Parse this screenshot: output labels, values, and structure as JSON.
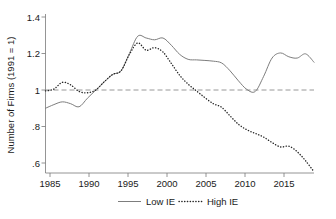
{
  "chart_data": {
    "type": "line",
    "title": "",
    "xlabel": "",
    "ylabel": "Number of Firms (1991 = 1)",
    "xlim": [
      1985,
      2017
    ],
    "ylim": [
      0.52,
      1.45
    ],
    "grid": false,
    "legend_position": "bottom",
    "xticks": [
      1985,
      1990,
      1995,
      2000,
      2005,
      2010,
      2015
    ],
    "xtick_labels": [
      "1985",
      "1990",
      "1995",
      "2000",
      "2005",
      "2010",
      "2015"
    ],
    "yticks": [
      0.6,
      0.8,
      1.0,
      1.2,
      1.4
    ],
    "ytick_labels": [
      ".6",
      ".8",
      "1",
      "1.2",
      "1.4"
    ],
    "reference_line": {
      "y": 1.0,
      "style": "dashed",
      "color": "#8d8d8d"
    },
    "x": [
      1985,
      1986,
      1987,
      1988,
      1989,
      1990,
      1991,
      1992,
      1993,
      1994,
      1995,
      1996,
      1997,
      1998,
      1999,
      2000,
      2001,
      2002,
      2003,
      2004,
      2005,
      2006,
      2007,
      2008,
      2009,
      2010,
      2011,
      2012,
      2013,
      2014,
      2015,
      2016,
      2017
    ],
    "series": [
      {
        "name": "Low IE",
        "style": "solid",
        "color": "#7d7d7d",
        "values": [
          0.9,
          0.92,
          0.935,
          0.925,
          0.908,
          0.955,
          1.0,
          1.045,
          1.085,
          1.105,
          1.2,
          1.295,
          1.285,
          1.275,
          1.285,
          1.245,
          1.195,
          1.168,
          1.165,
          1.162,
          1.158,
          1.148,
          1.105,
          1.05,
          1.003,
          0.992,
          1.075,
          1.175,
          1.203,
          1.182,
          1.175,
          1.198,
          1.152
        ]
      },
      {
        "name": "High IE",
        "style": "dotted",
        "color": "#262626",
        "values": [
          0.995,
          1.005,
          1.042,
          1.028,
          0.992,
          0.985,
          1.0,
          1.045,
          1.085,
          1.105,
          1.195,
          1.258,
          1.218,
          1.232,
          1.208,
          1.145,
          1.08,
          1.032,
          0.995,
          0.958,
          0.925,
          0.905,
          0.858,
          0.812,
          0.782,
          0.762,
          0.742,
          0.712,
          0.688,
          0.692,
          0.662,
          0.612,
          0.552
        ]
      }
    ]
  },
  "axes": {
    "ylabel": "Number of Firms (1991 = 1)",
    "ytick_labels": [
      ".6",
      ".8",
      "1",
      "1.2",
      "1.4"
    ],
    "xtick_labels": [
      "1985",
      "1990",
      "1995",
      "2000",
      "2005",
      "2010",
      "2015"
    ]
  },
  "legend": {
    "items": [
      {
        "label": "Low IE",
        "style": "solid"
      },
      {
        "label": "High IE",
        "style": "dotted"
      }
    ]
  }
}
